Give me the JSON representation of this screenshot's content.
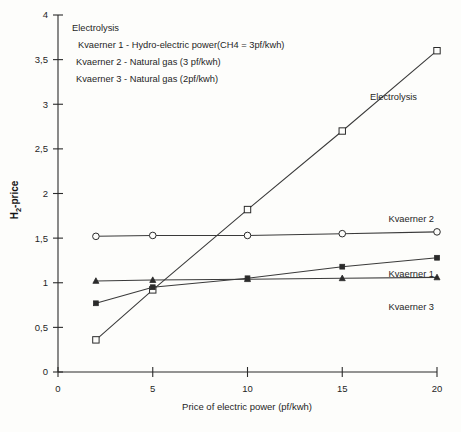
{
  "chart_data": {
    "type": "line",
    "title": "",
    "xlabel": "Price of electric power (pf/kwh)",
    "ylabel": "H2-price",
    "ylabel_parts": {
      "base": "H",
      "sub": "2",
      "rest": "-price"
    },
    "xlim": [
      0,
      20
    ],
    "ylim": [
      0,
      4
    ],
    "grid": false,
    "legend_position": "upper-left-inside",
    "x": [
      2,
      5,
      10,
      15,
      20
    ],
    "xticks": [
      "0",
      "5",
      "10",
      "15",
      "20"
    ],
    "xtick_values": [
      0,
      5,
      10,
      15,
      20
    ],
    "yticks": [
      "0",
      "0,5",
      "1",
      "1,5",
      "2",
      "2,5",
      "3",
      "3,5",
      "4"
    ],
    "ytick_values": [
      0,
      0.5,
      1,
      1.5,
      2,
      2.5,
      3,
      3.5,
      4
    ],
    "series": [
      {
        "name": "Electrolysis",
        "marker": "open-square",
        "values": [
          0.36,
          0.92,
          1.82,
          2.7,
          3.6
        ],
        "inline_label": "Electrolysis"
      },
      {
        "name": "Kvaerner 2",
        "marker": "open-circle",
        "values": [
          1.52,
          1.53,
          1.53,
          1.55,
          1.57
        ],
        "inline_label": "Kvaerner 2"
      },
      {
        "name": "Kvaerner 1",
        "marker": "filled-square",
        "values": [
          0.77,
          0.95,
          1.05,
          1.18,
          1.28
        ],
        "inline_label": "Kvaerner 1"
      },
      {
        "name": "Kvaerner 3",
        "marker": "filled-triangle",
        "values": [
          1.02,
          1.03,
          1.04,
          1.05,
          1.06
        ],
        "inline_label": "Kvaerner 3"
      }
    ],
    "legend_lines": [
      "Electrolysis",
      "Kvaerner 1 - Hydro-electric power(CH4 = 3pf/kwh)",
      "Kvaerner 2 - Natural gas (3 pf/kwh)",
      "Kvaerner 3 - Natural gas (2pf/kwh)"
    ]
  }
}
